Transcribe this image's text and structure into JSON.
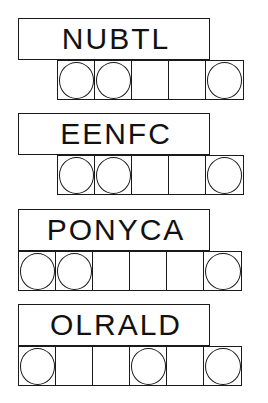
{
  "puzzles": [
    {
      "scrambled": "NUBTL",
      "length": 5,
      "circled": [
        0,
        1,
        4
      ]
    },
    {
      "scrambled": "EENFC",
      "length": 5,
      "circled": [
        0,
        1,
        4
      ]
    },
    {
      "scrambled": "PONYCA",
      "length": 6,
      "circled": [
        0,
        1,
        5
      ]
    },
    {
      "scrambled": "OLRALD",
      "length": 6,
      "circled": [
        0,
        3,
        5
      ]
    }
  ],
  "colors": {
    "stroke": "#1a1a1a",
    "background": "#ffffff",
    "text": "#111111"
  }
}
